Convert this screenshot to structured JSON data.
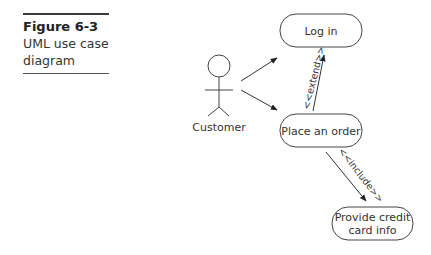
{
  "caption": {
    "figure_number": "Figure 6-3",
    "title_line1": "UML use case",
    "title_line2": "diagram"
  },
  "diagram": {
    "type": "UML use case diagram",
    "actor": {
      "name": "Customer",
      "icon": "stick-figure-icon"
    },
    "use_cases": [
      {
        "id": "login",
        "label": "Log in"
      },
      {
        "id": "order",
        "label": "Place an order"
      },
      {
        "id": "credit",
        "label_line1": "Provide credit",
        "label_line2": "card info"
      }
    ],
    "relationships": [
      {
        "from": "Customer",
        "to": "Log in",
        "type": "association"
      },
      {
        "from": "Customer",
        "to": "Place an order",
        "type": "association"
      },
      {
        "from": "Place an order",
        "to": "Log in",
        "type": "extend",
        "label": "<<extend>>"
      },
      {
        "from": "Place an order",
        "to": "Provide credit card info",
        "type": "include",
        "label": "<<include>>"
      }
    ]
  },
  "colors": {
    "line": "#333333",
    "background": "#ffffff"
  }
}
